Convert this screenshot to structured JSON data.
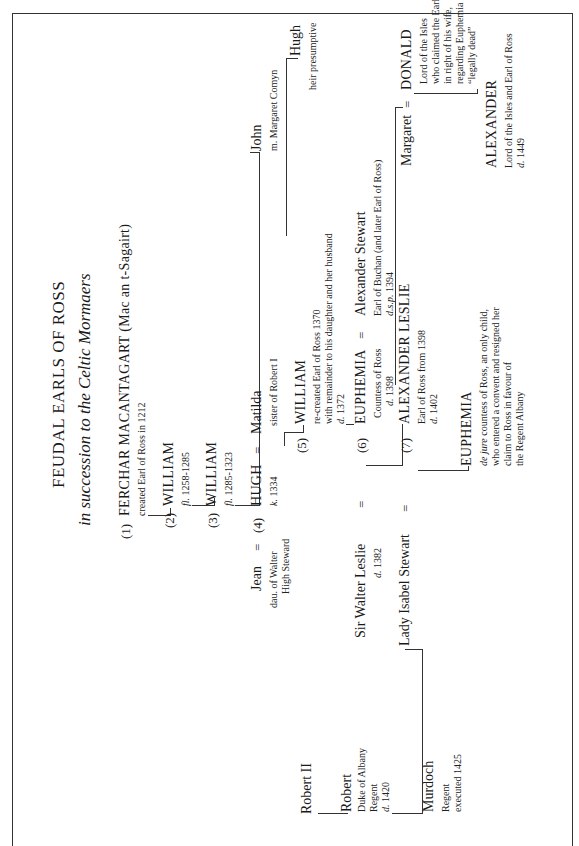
{
  "title": "FEUDAL EARLS OF ROSS",
  "subtitle": "in succession to the Celtic Mormaers",
  "equals": "=",
  "people": {
    "ferchar": {
      "num": "(1)",
      "name": "FERCHAR MACANTAGART (Mac an t-Sagairt)",
      "note": "created Earl of Ross in 1212"
    },
    "william2": {
      "num": "(2)",
      "name": "WILLIAM",
      "note_it": "fl.",
      "note": "1258-1285"
    },
    "william3": {
      "num": "(3)",
      "name": "WILLIAM",
      "note_it": "fl.",
      "note": "1285-1323"
    },
    "jean": {
      "name": "Jean",
      "notes": [
        "dau. of Walter",
        "High Steward"
      ]
    },
    "hugh4": {
      "num": "(4)",
      "name": "HUGH",
      "note_it": "k.",
      "note": "1334"
    },
    "matilda": {
      "name": "Matilda",
      "note": "sister of Robert I"
    },
    "john": {
      "name": "John",
      "note": "m. Margaret Comyn"
    },
    "hugh_heir": {
      "name": "Hugh",
      "note": "heir presumptive"
    },
    "william5": {
      "num": "(5)",
      "name": "WILLIAM",
      "notes": [
        "re-created Earl of Ross 1370",
        "with remainder to his daughter and her husband"
      ],
      "death_it": "d.",
      "death": "1372"
    },
    "walter_leslie": {
      "name": "Sir Walter Leslie",
      "death_it": "d.",
      "death": "1382"
    },
    "euphemia6": {
      "num": "(6)",
      "name": "EUPHEMIA",
      "note": "Countess of Ross",
      "death_it": "d.",
      "death": "1398"
    },
    "alexander_stewart": {
      "name": "Alexander Stewart",
      "note": "Earl of Buchan (and later Earl of Ross)",
      "death_it": "d.s.p.",
      "death": "1394"
    },
    "robert2": {
      "name": "Robert II"
    },
    "robert_albany": {
      "name": "Robert",
      "notes": [
        "Duke of Albany",
        "Regent"
      ],
      "death_it": "d.",
      "death": "1420"
    },
    "isabel": {
      "name": "Lady Isabel Stewart"
    },
    "alexander_leslie": {
      "num": "(7)",
      "name": "ALEXANDER LESLIE",
      "note": "Earl of Ross from 1398",
      "death_it": "d.",
      "death": "1402"
    },
    "margaret": {
      "name": "Margaret"
    },
    "donald": {
      "name": "DONALD",
      "notes": [
        "Lord of the Isles",
        "who claimed the Earldom",
        "in right of his wife,",
        "regarding Euphemia as",
        "“legally dead”"
      ]
    },
    "murdoch": {
      "name": "Murdoch",
      "notes": [
        "Regent",
        "executed 1425"
      ]
    },
    "euphemia_jure": {
      "name": "EUPHEMIA",
      "note_it": "de jure",
      "notes": [
        "countess of Ross, an only child,",
        "who entered a convent and resigned her",
        "claim to Ross in favour of",
        "the Regent Albany"
      ]
    },
    "alexander_isles": {
      "name": "ALEXANDER",
      "note": "Lord of the Isles and Earl of Ross",
      "death_it": "d.",
      "death": "1449"
    }
  }
}
